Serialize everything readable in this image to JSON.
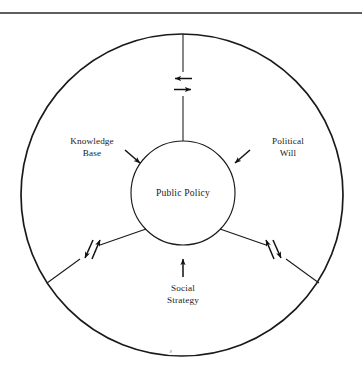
{
  "figure": {
    "type": "concentric-circle-diagram",
    "background_color": "#ffffff",
    "stroke_color": "#1a1a1a",
    "text_color": "#1a1a1a",
    "top_rule": {
      "name": "horizontal-rule",
      "y": 13,
      "x_start": 0,
      "x_end": 362
    },
    "outer_circle": {
      "cx": 182,
      "cy": 195,
      "r": 161,
      "stroke_width": 1.6
    },
    "inner_circle": {
      "cx": 183,
      "cy": 193,
      "r": 52,
      "stroke_width": 1.1
    },
    "center_label": "Public Policy",
    "spokes": [
      {
        "id": "top",
        "direction": "up",
        "arrow_pair": [
          "left",
          "right"
        ],
        "arrow_style": "bidirectional-horizontal"
      },
      {
        "id": "lower-left",
        "direction": "down-left",
        "arrow_pair": [
          "outward",
          "inward"
        ],
        "arrow_style": "bidirectional-diagonal"
      },
      {
        "id": "lower-right",
        "direction": "down-right",
        "arrow_pair": [
          "outward",
          "inward"
        ],
        "arrow_style": "bidirectional-diagonal"
      }
    ],
    "labels": [
      {
        "id": "knowledge-base",
        "lines": [
          "Knowledge",
          "Base"
        ],
        "x": 92,
        "y": 144,
        "pointer": "arrow-down-right"
      },
      {
        "id": "political-will",
        "lines": [
          "Political",
          "Will"
        ],
        "x": 288,
        "y": 144,
        "pointer": "arrow-down-left"
      },
      {
        "id": "social-strategy",
        "lines": [
          "Social",
          "Strategy"
        ],
        "x": 183,
        "y": 291,
        "pointer": "arrow-up"
      }
    ]
  }
}
